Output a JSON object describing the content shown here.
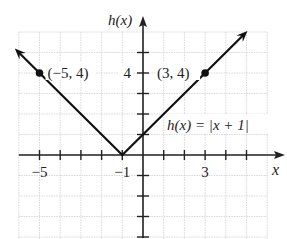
{
  "chart_data": {
    "type": "line",
    "title": "",
    "function_label": "h(x) = |x + 1|",
    "xlabel": "x",
    "ylabel": "h(x)",
    "xlim": [
      -6,
      6
    ],
    "ylim": [
      -4,
      6
    ],
    "grid": true,
    "x_tick_labels": [
      {
        "value": -5,
        "label": "−5"
      },
      {
        "value": -1,
        "label": "−1"
      },
      {
        "value": 3,
        "label": "3"
      }
    ],
    "y_tick_labels": [
      {
        "value": 4,
        "label": "4"
      }
    ],
    "series": [
      {
        "name": "h(x) = |x + 1|",
        "x": [
          -6,
          -5,
          -1,
          3,
          4.9
        ],
        "y": [
          5,
          4,
          0,
          4,
          5.9
        ],
        "arrows": "both"
      }
    ],
    "points": [
      {
        "x": -5,
        "y": 4,
        "label": "(−5, 4)"
      },
      {
        "x": 3,
        "y": 4,
        "label": "(3, 4)"
      },
      {
        "x": -1,
        "y": 0,
        "label": ""
      }
    ]
  },
  "top_cut_text": "(−∞, ∞), [0, ∞)"
}
